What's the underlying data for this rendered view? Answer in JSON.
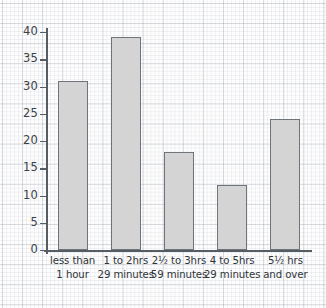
{
  "chart_data": {
    "type": "bar",
    "title": "",
    "subtitle": "",
    "xlabel": "",
    "ylabel": "",
    "categories": [
      "less than 1 hour",
      "1 to 2hrs 29 minutes",
      "2½ to 3hrs 59 minutes",
      "4 to 5hrs 29 minutes",
      "5½ hrs and over"
    ],
    "category_lines": [
      [
        "less than",
        "1 hour"
      ],
      [
        "1 to 2hrs",
        "29 minutes"
      ],
      [
        "2½ to 3hrs",
        "59 minutes"
      ],
      [
        "4 to 5hrs",
        "29 minutes"
      ],
      [
        "5½ hrs",
        "and over"
      ]
    ],
    "values": [
      31,
      39,
      18,
      12,
      24
    ],
    "ylim": [
      0,
      40
    ],
    "ytick_labels": [
      "0",
      "5",
      "10",
      "15",
      "20",
      "25",
      "30",
      "35",
      "40"
    ],
    "ytick_values": [
      0,
      5,
      10,
      15,
      20,
      25,
      30,
      35,
      40
    ],
    "grid": true,
    "legend": "none",
    "bar_fill_color": "#d4d4d4",
    "bar_edge_color": "#6e7479",
    "axis_color": "#555c63",
    "background_color": "#fdfdfd",
    "grid_color": "#8c96a0"
  }
}
